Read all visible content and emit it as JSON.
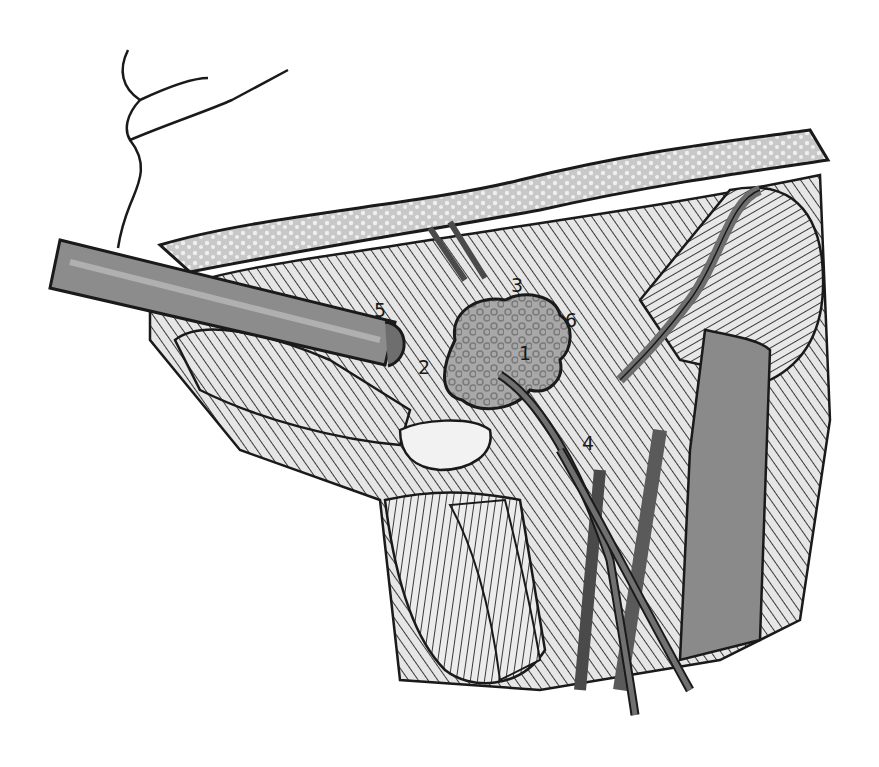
{
  "figure": {
    "type": "surgical-anatomy-illustration",
    "style": "grayscale line drawing",
    "labels": [
      {
        "id": "1",
        "text": "1",
        "x": 519,
        "y": 344
      },
      {
        "id": "2",
        "text": "2",
        "x": 418,
        "y": 358
      },
      {
        "id": "3",
        "text": "3",
        "x": 511,
        "y": 276
      },
      {
        "id": "4",
        "text": "4",
        "x": 582,
        "y": 434
      },
      {
        "id": "5",
        "text": "5",
        "x": 374,
        "y": 301
      },
      {
        "id": "6",
        "text": "6",
        "x": 565,
        "y": 311
      }
    ],
    "colors": {
      "ink": "#1a1a1a",
      "tissue_light": "#d9d9d9",
      "tissue_mid": "#9a9a9a",
      "tissue_dark": "#6e6e6e",
      "vessel": "#5a5a5a",
      "retractor": "#8c8c8c",
      "mass": "#a6a6a6",
      "background": "#ffffff"
    }
  }
}
